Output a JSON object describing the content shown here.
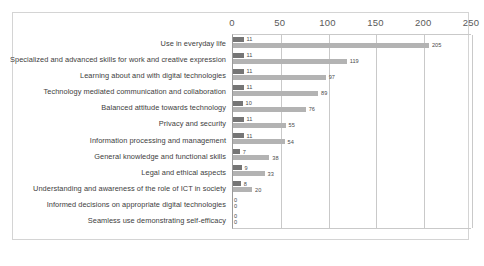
{
  "chart_data": {
    "type": "bar",
    "orientation": "horizontal",
    "title": "",
    "xlabel": "",
    "ylabel": "",
    "xlim": [
      0,
      250
    ],
    "xticks": [
      0,
      50,
      100,
      150,
      200,
      250
    ],
    "grid": true,
    "legend": "none",
    "categories": [
      "Use in everyday life",
      "Specialized and advanced skills for work and creative expression",
      "Learning about and with digital technologies",
      "Technology mediated communication and collaboration",
      "Balanced attitude towards technology",
      "Privacy and security",
      "Information processing and management",
      "General knowledge and functional skills",
      "Legal and ethical aspects",
      "Understanding and awareness of the role of ICT in society",
      "Informed decisions on appropriate digital technologies",
      "Seamless use demonstrating self-efficacy"
    ],
    "series": [
      {
        "name": "series-1",
        "color": "#767676",
        "values": [
          11,
          11,
          11,
          11,
          10,
          11,
          11,
          7,
          9,
          8,
          0,
          0
        ]
      },
      {
        "name": "series-2",
        "color": "#b3b3b3",
        "values": [
          205,
          119,
          97,
          89,
          76,
          55,
          54,
          38,
          33,
          20,
          0,
          0
        ]
      }
    ]
  },
  "colors": {
    "series_dark": "#767676",
    "series_light": "#b3b3b3",
    "gridline": "#c9c9c9",
    "axis": "#9a9a9a",
    "frame_border": "#d4d4d4",
    "background": "#ffffff",
    "tick_text": "#5a5a5a",
    "category_text": "#3d3d3d",
    "value_text": "#4a4a4a"
  }
}
